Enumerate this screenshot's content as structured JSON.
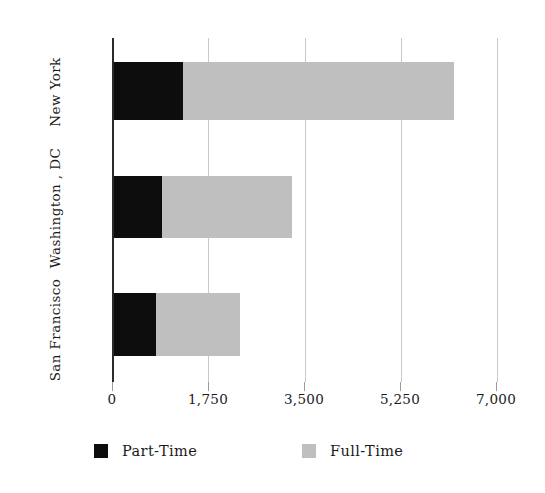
{
  "chart_data": {
    "type": "bar",
    "orientation": "horizontal",
    "stacked": true,
    "title": "",
    "subtitle": "",
    "xlabel": "",
    "ylabel": "",
    "categories": [
      "New York",
      "Washington , DC",
      "San Francisco"
    ],
    "series": [
      {
        "name": "Part-Time",
        "color": "#0d0d0d",
        "values": [
          1290,
          905,
          800
        ]
      },
      {
        "name": "Full-Time",
        "color": "#bfbfbf",
        "values": [
          4930,
          2370,
          1520
        ]
      }
    ],
    "totals": [
      6220,
      3275,
      2320
    ],
    "xlim": [
      0,
      7000
    ],
    "xticks": [
      0,
      1750,
      3500,
      5250,
      7000
    ],
    "xtick_labels": [
      "0",
      "1,750",
      "3,500",
      "5,250",
      "7,000"
    ],
    "grid": true,
    "grid_axis": "x",
    "legend_position": "bottom",
    "legend_entries": [
      "Part-Time",
      "Full-Time"
    ],
    "axis_line_color": "#2b2b2b",
    "grid_color": "#c9c9c9",
    "background_color": "#ffffff"
  },
  "axis": {
    "x": {
      "ticks": [
        {
          "label": "0",
          "value": 0
        },
        {
          "label": "1,750",
          "value": 1750
        },
        {
          "label": "3,500",
          "value": 3500
        },
        {
          "label": "5,250",
          "value": 5250
        },
        {
          "label": "7,000",
          "value": 7000
        }
      ]
    },
    "y": {
      "ticks": [
        {
          "label": "New York"
        },
        {
          "label": "Washington , DC"
        },
        {
          "label": "San Francisco"
        }
      ]
    }
  },
  "legend": {
    "items": [
      {
        "label": "Part-Time",
        "color": "#0d0d0d"
      },
      {
        "label": "Full-Time",
        "color": "#bfbfbf"
      }
    ]
  }
}
